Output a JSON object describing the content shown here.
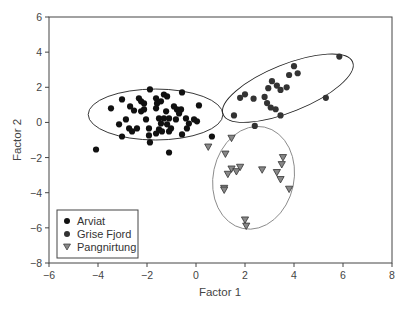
{
  "chart_data": {
    "type": "scatter",
    "title": "",
    "xlabel": "Factor 1",
    "ylabel": "Factor 2",
    "xlim": [
      -6,
      8
    ],
    "ylim": [
      -8,
      6
    ],
    "xticks": [
      -6,
      -4,
      -2,
      0,
      2,
      4,
      6,
      8
    ],
    "yticks": [
      -8,
      -6,
      -4,
      -2,
      0,
      2,
      4,
      6
    ],
    "xtick_labels": [
      "−6",
      "−4",
      "−2",
      "0",
      "2",
      "4",
      "6",
      "8"
    ],
    "ytick_labels": [
      "−8",
      "−6",
      "−4",
      "−2",
      "0",
      "2",
      "4",
      "6"
    ],
    "grid": false,
    "legend_position": "lower left",
    "series": [
      {
        "name": "Arviat",
        "marker": "circle",
        "color": "#111111",
        "points": [
          [
            -3.47,
            0.8
          ],
          [
            -3.02,
            1.31
          ],
          [
            -2.69,
            0.91
          ],
          [
            -2.33,
            1.37
          ],
          [
            -2.24,
            1.2
          ],
          [
            -2.12,
            1.08
          ],
          [
            -1.88,
            1.88
          ],
          [
            -2.53,
            0.68
          ],
          [
            -2.24,
            0.63
          ],
          [
            -2.12,
            0.74
          ],
          [
            -2.86,
            0.17
          ],
          [
            -3.14,
            -0.11
          ],
          [
            -2.73,
            -0.34
          ],
          [
            -2.61,
            -0.51
          ],
          [
            -2.41,
            -0.34
          ],
          [
            -3.02,
            -0.8
          ],
          [
            -1.92,
            -0.34
          ],
          [
            -1.92,
            -0.74
          ],
          [
            -1.88,
            -1.14
          ],
          [
            -1.63,
            1.37
          ],
          [
            -1.59,
            1.08
          ],
          [
            -1.63,
            0.8
          ],
          [
            -1.43,
            1.2
          ],
          [
            -1.31,
            1.59
          ],
          [
            -1.18,
            1.48
          ],
          [
            -1.22,
            0.63
          ],
          [
            -1.51,
            0.23
          ],
          [
            -1.43,
            -0.06
          ],
          [
            -1.51,
            -0.4
          ],
          [
            -1.63,
            -0.63
          ],
          [
            -1.31,
            0.23
          ],
          [
            -1.1,
            0.23
          ],
          [
            -1.18,
            -0.11
          ],
          [
            -1.02,
            -0.34
          ],
          [
            -0.82,
            0.17
          ],
          [
            -0.9,
            0.91
          ],
          [
            -0.78,
            0.74
          ],
          [
            -0.61,
            0.74
          ],
          [
            -0.69,
            0.51
          ],
          [
            -0.57,
            1.71
          ],
          [
            -0.41,
            0.23
          ],
          [
            -0.29,
            -0.06
          ],
          [
            -0.37,
            -0.34
          ],
          [
            -0.08,
            0.17
          ],
          [
            0.04,
            0.06
          ],
          [
            0.12,
            0.97
          ],
          [
            -0.57,
            -0.68
          ],
          [
            -1.39,
            -0.51
          ],
          [
            -1.1,
            -0.51
          ],
          [
            -2.04,
            0.17
          ],
          [
            -4.08,
            -1.54
          ],
          [
            -1.1,
            -1.71
          ],
          [
            0.65,
            -0.8
          ]
        ]
      },
      {
        "name": "Grise Fjord",
        "marker": "circle",
        "color": "#333333",
        "points": [
          [
            1.55,
            0.4
          ],
          [
            2.0,
            1.6
          ],
          [
            2.35,
            1.35
          ],
          [
            2.95,
            1.95
          ],
          [
            3.1,
            2.35
          ],
          [
            3.3,
            2.1
          ],
          [
            2.8,
            1.45
          ],
          [
            2.9,
            1.1
          ],
          [
            3.05,
            0.85
          ],
          [
            3.25,
            0.75
          ],
          [
            3.45,
            1.85
          ],
          [
            3.7,
            2.0
          ],
          [
            3.8,
            2.7
          ],
          [
            4.0,
            3.2
          ],
          [
            4.15,
            2.8
          ],
          [
            3.45,
            0.4
          ],
          [
            5.3,
            1.4
          ],
          [
            5.85,
            3.75
          ],
          [
            2.4,
            -0.2
          ],
          [
            1.8,
            1.4
          ]
        ]
      },
      {
        "name": "Pangnirtung",
        "marker": "triangle-down",
        "color": "#888888",
        "points": [
          [
            0.5,
            -1.4
          ],
          [
            1.45,
            -0.9
          ],
          [
            1.2,
            -1.8
          ],
          [
            1.45,
            -2.65
          ],
          [
            1.3,
            -2.95
          ],
          [
            1.65,
            -2.8
          ],
          [
            1.8,
            -2.55
          ],
          [
            2.7,
            -2.7
          ],
          [
            1.15,
            -3.75
          ],
          [
            3.55,
            -2.0
          ],
          [
            3.5,
            -2.4
          ],
          [
            3.3,
            -2.85
          ],
          [
            3.45,
            -3.25
          ],
          [
            3.8,
            -3.8
          ],
          [
            2.0,
            -5.55
          ],
          [
            2.05,
            -5.9
          ],
          [
            1.15,
            -3.85
          ]
        ]
      }
    ],
    "ellipses": [
      {
        "group": "Arviat",
        "cx": -1.65,
        "cy": 0.45,
        "rx": 2.75,
        "ry": 1.45,
        "angle_deg": 0,
        "stroke": "#222222"
      },
      {
        "group": "Grise Fjord",
        "cx": 3.75,
        "cy": 1.95,
        "rx": 2.85,
        "ry": 1.35,
        "angle_deg": 22,
        "stroke": "#222222"
      },
      {
        "group": "Pangnirtung",
        "cx": 2.35,
        "cy": -3.15,
        "rx": 1.65,
        "ry": 2.95,
        "angle_deg": -12,
        "stroke": "#888888"
      }
    ],
    "legend": [
      "Arviat",
      "Grise Fjord",
      "Pangnirtung"
    ]
  },
  "axes": {
    "xlabel": "Factor 1",
    "ylabel": "Factor 2"
  },
  "legend": {
    "items": [
      {
        "label": "Arviat",
        "icon": "filled-circle",
        "color": "#111111"
      },
      {
        "label": "Grise Fjord",
        "icon": "filled-circle",
        "color": "#333333"
      },
      {
        "label": "Pangnirtung",
        "icon": "down-triangle",
        "color": "#888888"
      }
    ]
  }
}
